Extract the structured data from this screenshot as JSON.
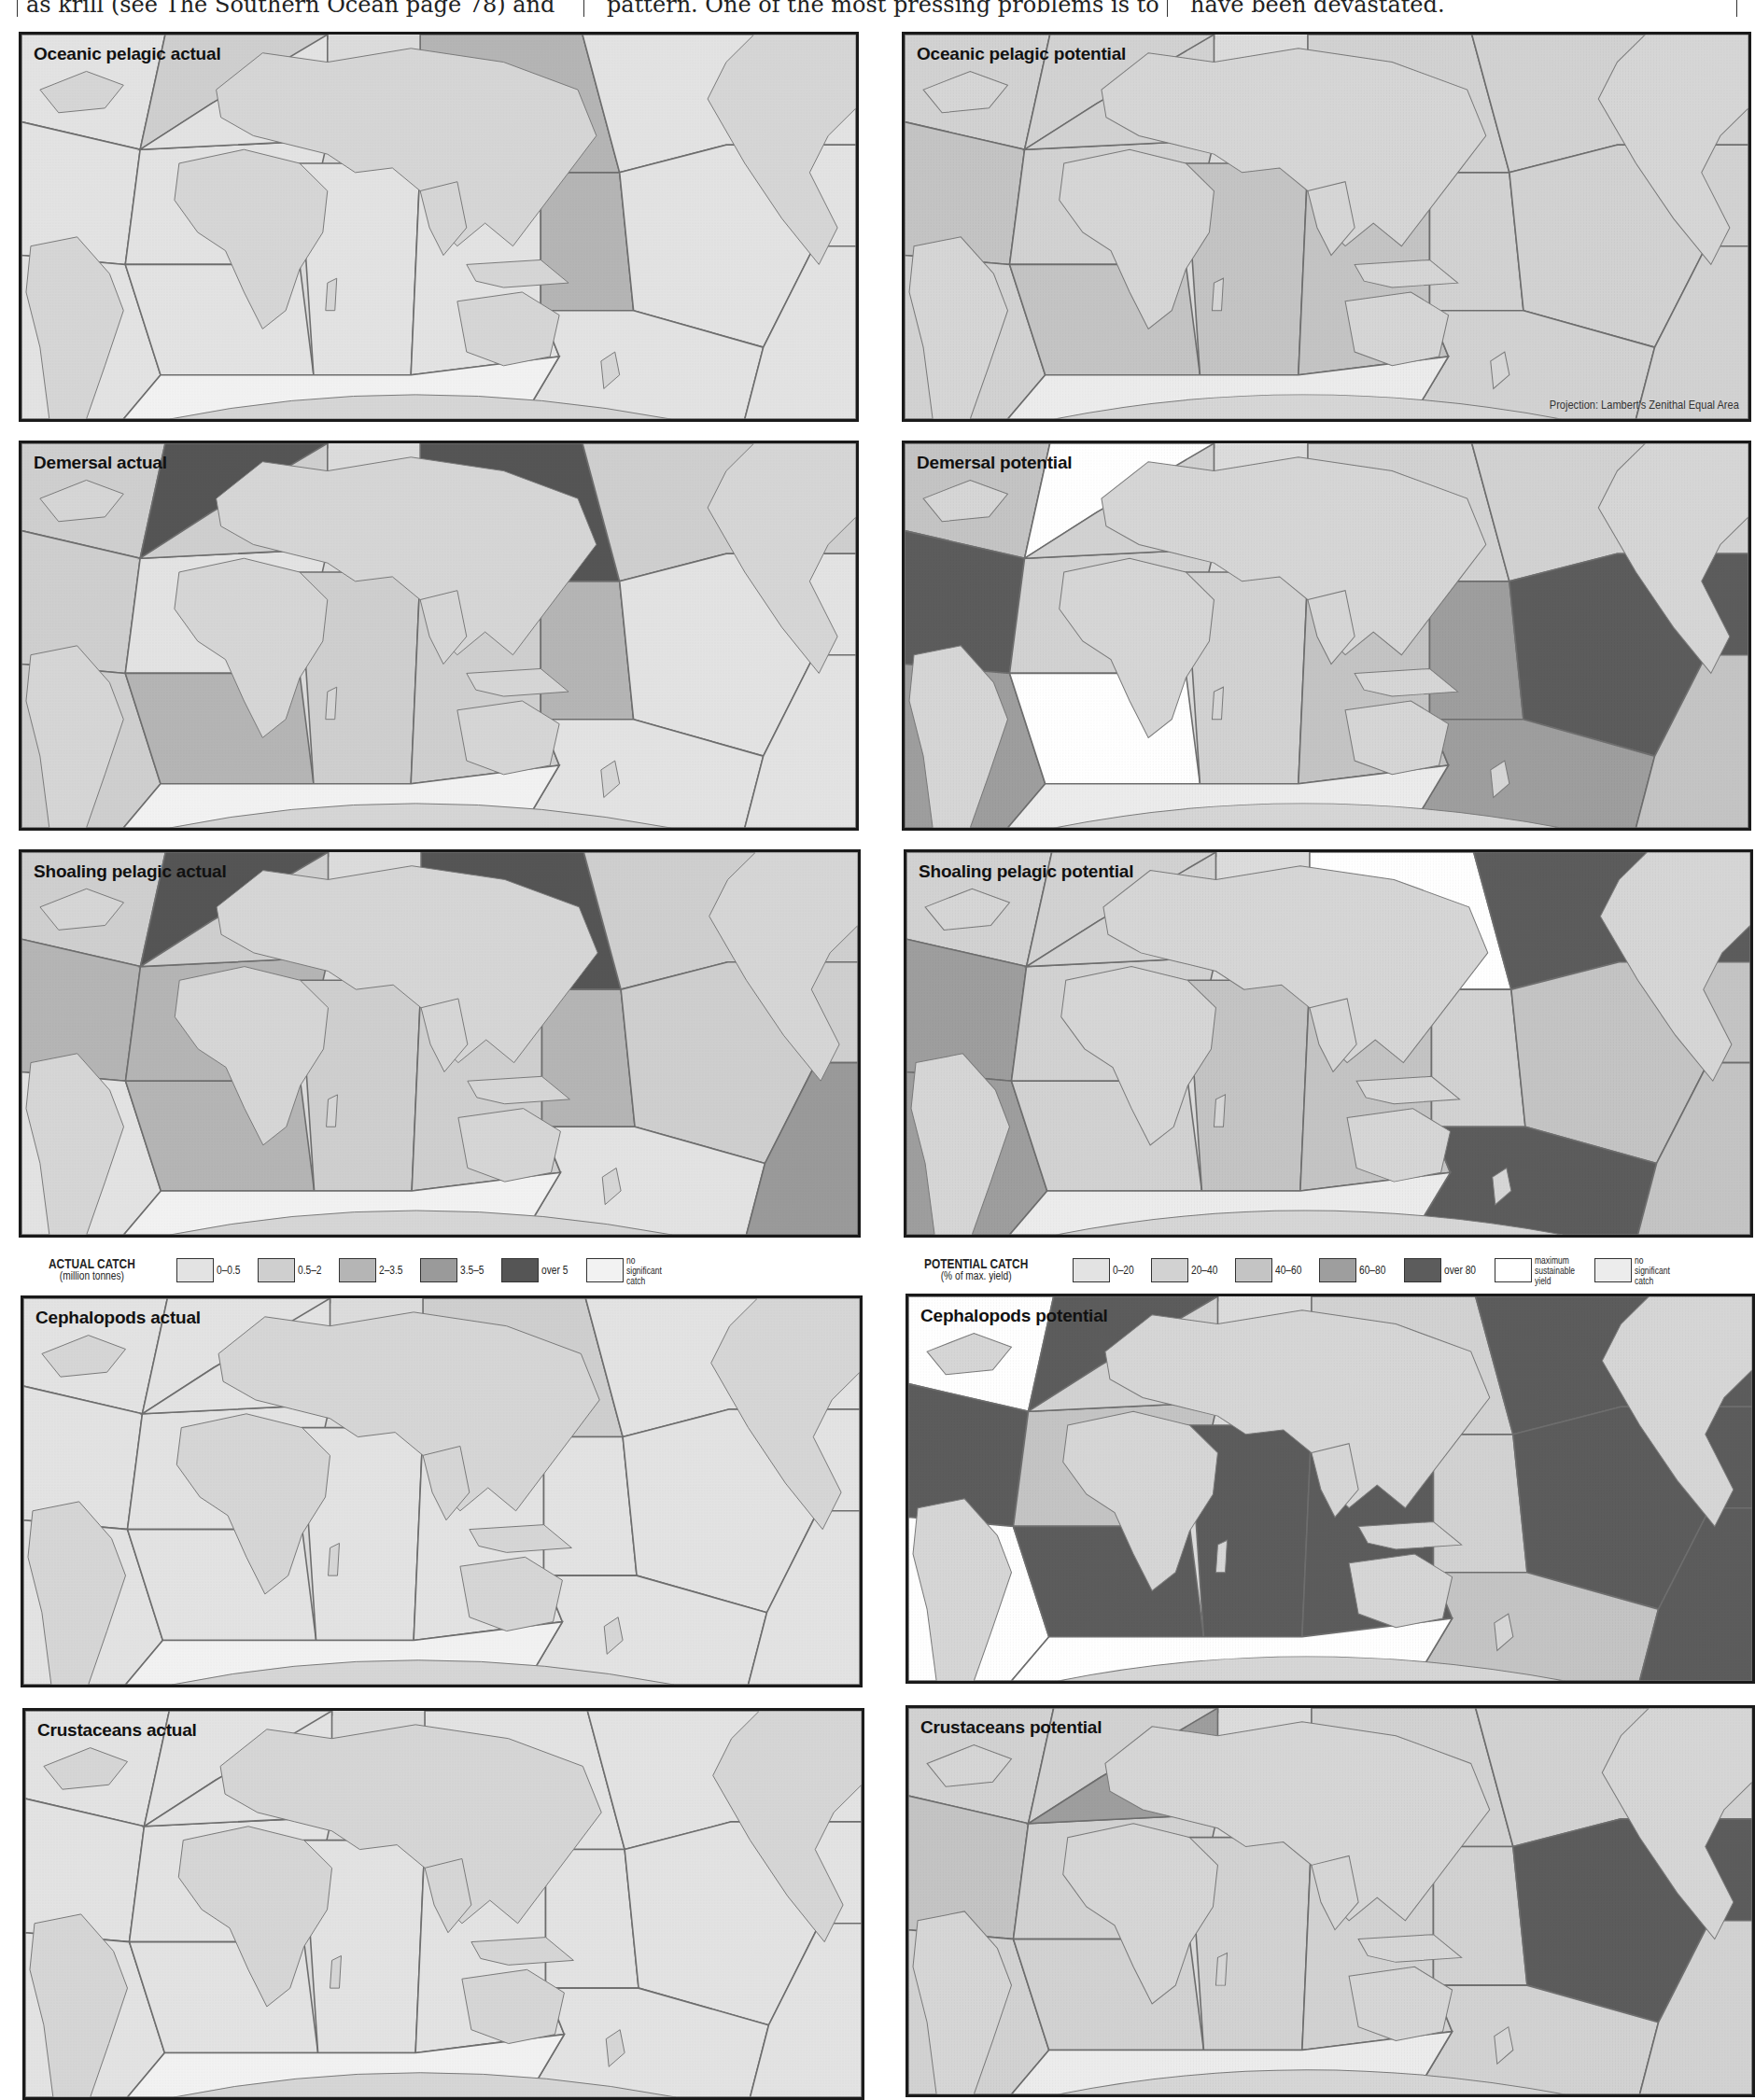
{
  "header_text": {
    "col1": "as krill (see The Southern Ocean page 78) and",
    "col2": "pattern. One of the most pressing problems is to",
    "col3": "have been devastated."
  },
  "colors": {
    "land": "#d6d6d6",
    "coast": "#7a7a7a",
    "zone_border": "#6e6e6e",
    "actual_levels": {
      "0": "#e3e3e3",
      "1": "#cfcfcf",
      "2": "#b5b5b5",
      "3": "#9a9a9a",
      "4": "#555555",
      "n": "#f2f2f2"
    },
    "potential_levels": {
      "0": "#e3e3e3",
      "1": "#d2d2d2",
      "2": "#c4c4c4",
      "3": "#9e9e9e",
      "4": "#5c5c5c",
      "m": "#ffffff",
      "n": "#ececec"
    }
  },
  "projection_note": "Projection: Lambert's Zenithal Equal Area",
  "legend_actual": {
    "title": "ACTUAL CATCH",
    "subtitle": "(million tonnes)",
    "items": [
      {
        "label": "0–0.5",
        "color": "#e3e3e3"
      },
      {
        "label": "0.5–2",
        "color": "#cfcfcf"
      },
      {
        "label": "2–3.5",
        "color": "#b5b5b5"
      },
      {
        "label": "3.5–5",
        "color": "#9a9a9a"
      },
      {
        "label": "over 5",
        "color": "#555555"
      },
      {
        "label": "no significant catch",
        "color": "#f2f2f2"
      }
    ]
  },
  "legend_potential": {
    "title": "POTENTIAL CATCH",
    "subtitle": "(% of max. yield)",
    "items": [
      {
        "label": "0–20",
        "color": "#e3e3e3"
      },
      {
        "label": "20–40",
        "color": "#d2d2d2"
      },
      {
        "label": "40–60",
        "color": "#c4c4c4"
      },
      {
        "label": "60–80",
        "color": "#9e9e9e"
      },
      {
        "label": "over 80",
        "color": "#5c5c5c"
      },
      {
        "label": "maximum sustainable yield",
        "color": "#ffffff"
      },
      {
        "label": "no significant catch",
        "color": "#ececec"
      }
    ]
  },
  "zones": [
    "NW Atlantic",
    "NE Atlantic",
    "W Central Atlantic",
    "E Central Atlantic",
    "SW Atlantic",
    "SE Atlantic",
    "W Indian",
    "E Indian",
    "NW Pacific",
    "NE Pacific",
    "W Central Pacific",
    "E Central Pacific",
    "SW Pacific",
    "SE Pacific",
    "Mediterranean",
    "Antarctic"
  ],
  "panels": [
    {
      "title": "Oceanic pelagic actual",
      "kind": "actual",
      "fills": {
        "NW Atlantic": "0",
        "NE Atlantic": "1",
        "W Central Atlantic": "0",
        "E Central Atlantic": "0",
        "SW Atlantic": "0",
        "SE Atlantic": "0",
        "W Indian": "0",
        "E Indian": "0",
        "NW Pacific": "2",
        "NE Pacific": "0",
        "W Central Pacific": "2",
        "E Central Pacific": "0",
        "SW Pacific": "0",
        "SE Pacific": "0",
        "Mediterranean": "0",
        "Antarctic": "n"
      }
    },
    {
      "title": "Oceanic pelagic potential",
      "kind": "potential",
      "fills": {
        "NW Atlantic": "1",
        "NE Atlantic": "1",
        "W Central Atlantic": "2",
        "E Central Atlantic": "1",
        "SW Atlantic": "1",
        "SE Atlantic": "2",
        "W Indian": "2",
        "E Indian": "2",
        "NW Pacific": "1",
        "NE Pacific": "1",
        "W Central Pacific": "1",
        "E Central Pacific": "1",
        "SW Pacific": "1",
        "SE Pacific": "1",
        "Mediterranean": "1",
        "Antarctic": "n"
      }
    },
    {
      "title": "Demersal actual",
      "kind": "actual",
      "fills": {
        "NW Atlantic": "1",
        "NE Atlantic": "4",
        "W Central Atlantic": "1",
        "E Central Atlantic": "0",
        "SW Atlantic": "1",
        "SE Atlantic": "2",
        "W Indian": "1",
        "E Indian": "1",
        "NW Pacific": "4",
        "NE Pacific": "1",
        "W Central Pacific": "2",
        "E Central Pacific": "0",
        "SW Pacific": "0",
        "SE Pacific": "0",
        "Mediterranean": "1",
        "Antarctic": "n"
      }
    },
    {
      "title": "Demersal potential",
      "kind": "potential",
      "fills": {
        "NW Atlantic": "2",
        "NE Atlantic": "m",
        "W Central Atlantic": "4",
        "E Central Atlantic": "1",
        "SW Atlantic": "3",
        "SE Atlantic": "m",
        "W Indian": "1",
        "E Indian": "2",
        "NW Pacific": "1",
        "NE Pacific": "1",
        "W Central Pacific": "3",
        "E Central Pacific": "4",
        "SW Pacific": "3",
        "SE Pacific": "2",
        "Mediterranean": "1",
        "Antarctic": "n"
      }
    },
    {
      "title": "Shoaling pelagic actual",
      "kind": "actual",
      "fills": {
        "NW Atlantic": "1",
        "NE Atlantic": "4",
        "W Central Atlantic": "2",
        "E Central Atlantic": "2",
        "SW Atlantic": "0",
        "SE Atlantic": "2",
        "W Indian": "1",
        "E Indian": "1",
        "NW Pacific": "4",
        "NE Pacific": "1",
        "W Central Pacific": "2",
        "E Central Pacific": "1",
        "SW Pacific": "0",
        "SE Pacific": "3",
        "Mediterranean": "1",
        "Antarctic": "n"
      }
    },
    {
      "title": "Shoaling pelagic potential",
      "kind": "potential",
      "fills": {
        "NW Atlantic": "1",
        "NE Atlantic": "1",
        "W Central Atlantic": "3",
        "E Central Atlantic": "1",
        "SW Atlantic": "3",
        "SE Atlantic": "1",
        "W Indian": "2",
        "E Indian": "2",
        "NW Pacific": "m",
        "NE Pacific": "4",
        "W Central Pacific": "1",
        "E Central Pacific": "2",
        "SW Pacific": "4",
        "SE Pacific": "2",
        "Mediterranean": "1",
        "Antarctic": "n"
      }
    },
    {
      "title": "Cephalopods actual",
      "kind": "actual",
      "fills": {
        "NW Atlantic": "0",
        "NE Atlantic": "0",
        "W Central Atlantic": "0",
        "E Central Atlantic": "0",
        "SW Atlantic": "0",
        "SE Atlantic": "0",
        "W Indian": "0",
        "E Indian": "0",
        "NW Pacific": "1",
        "NE Pacific": "0",
        "W Central Pacific": "0",
        "E Central Pacific": "0",
        "SW Pacific": "0",
        "SE Pacific": "0",
        "Mediterranean": "0",
        "Antarctic": "n"
      }
    },
    {
      "title": "Cephalopods potential",
      "kind": "potential",
      "fills": {
        "NW Atlantic": "m",
        "NE Atlantic": "4",
        "W Central Atlantic": "4",
        "E Central Atlantic": "2",
        "SW Atlantic": "m",
        "SE Atlantic": "4",
        "W Indian": "4",
        "E Indian": "4",
        "NW Pacific": "1",
        "NE Pacific": "4",
        "W Central Pacific": "1",
        "E Central Pacific": "4",
        "SW Pacific": "2",
        "SE Pacific": "4",
        "Mediterranean": "1",
        "Antarctic": "m"
      }
    },
    {
      "title": "Crustaceans actual",
      "kind": "actual",
      "fills": {
        "NW Atlantic": "0",
        "NE Atlantic": "0",
        "W Central Atlantic": "0",
        "E Central Atlantic": "0",
        "SW Atlantic": "0",
        "SE Atlantic": "0",
        "W Indian": "0",
        "E Indian": "0",
        "NW Pacific": "0",
        "NE Pacific": "0",
        "W Central Pacific": "0",
        "E Central Pacific": "0",
        "SW Pacific": "0",
        "SE Pacific": "0",
        "Mediterranean": "0",
        "Antarctic": "n"
      }
    },
    {
      "title": "Crustaceans potential",
      "kind": "potential",
      "fills": {
        "NW Atlantic": "1",
        "NE Atlantic": "1",
        "W Central Atlantic": "2",
        "E Central Atlantic": "1",
        "SW Atlantic": "1",
        "SE Atlantic": "1",
        "W Indian": "1",
        "E Indian": "1",
        "NW Pacific": "1",
        "NE Pacific": "1",
        "W Central Pacific": "1",
        "E Central Pacific": "4",
        "SW Pacific": "1",
        "SE Pacific": "1",
        "Mediterranean": "3",
        "Antarctic": "n"
      }
    }
  ],
  "chart_data": {
    "type": "heatmap",
    "rows": [
      "Oceanic pelagic",
      "Demersal",
      "Shoaling pelagic",
      "Cephalopods",
      "Crustaceans"
    ],
    "columns": [
      "actual",
      "potential"
    ],
    "actual_scale": [
      "0–0.5",
      "0.5–2",
      "2–3.5",
      "3.5–5",
      "over 5",
      "no significant catch"
    ],
    "actual_units": "million tonnes",
    "potential_scale": [
      "0–20",
      "20–40",
      "40–60",
      "60–80",
      "over 80",
      "maximum sustainable yield",
      "no significant catch"
    ],
    "potential_units": "% of max. yield",
    "projection": "Lambert's Zenithal Equal Area"
  }
}
